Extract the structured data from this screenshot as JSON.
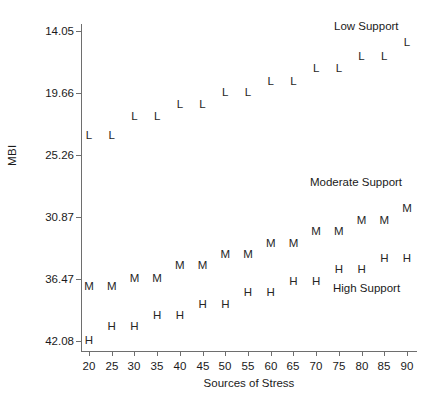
{
  "chart_data": {
    "type": "scatter",
    "title": "",
    "xlabel": "Sources of Stress",
    "ylabel": "MBI",
    "xlim": [
      17.5,
      92.5
    ],
    "ylim": [
      13.0,
      42.9
    ],
    "grid": false,
    "legend_position": "in-plot-annotations",
    "x_ticks": [
      20,
      25,
      30,
      35,
      40,
      45,
      50,
      55,
      60,
      65,
      70,
      75,
      80,
      85,
      90
    ],
    "y_ticks": [
      14.05,
      19.66,
      25.26,
      30.87,
      36.47,
      42.08
    ],
    "x": [
      20,
      25,
      30,
      35,
      40,
      45,
      50,
      55,
      60,
      65,
      70,
      75,
      80,
      85,
      90
    ],
    "series": [
      {
        "name": "Low Support",
        "marker": "L",
        "values": [
          32.6,
          32.6,
          34.3,
          34.3,
          35.4,
          35.4,
          36.5,
          36.5,
          37.5,
          37.5,
          38.6,
          38.6,
          39.7,
          39.7,
          41.0
        ]
      },
      {
        "name": "Moderate Support",
        "marker": "M",
        "values": [
          18.9,
          18.9,
          19.7,
          19.7,
          20.8,
          20.8,
          21.8,
          21.8,
          22.8,
          22.8,
          23.9,
          23.9,
          24.9,
          24.9,
          26.0
        ]
      },
      {
        "name": "High Support",
        "marker": "H",
        "values": [
          14.05,
          15.3,
          15.3,
          16.3,
          16.3,
          17.3,
          17.3,
          18.4,
          18.4,
          19.4,
          19.4,
          20.5,
          20.5,
          21.5,
          21.5
        ]
      }
    ],
    "annotations": [
      {
        "text": "Low Support",
        "for": "Low Support"
      },
      {
        "text": "Moderate Support",
        "for": "Moderate Support"
      },
      {
        "text": "High Support",
        "for": "High Support"
      }
    ]
  },
  "axis": {
    "y_title": "MBI",
    "x_title": "Sources of Stress",
    "y_tick_labels": [
      "42.08",
      "36.47",
      "30.87",
      "25.26",
      "19.66",
      "14.05"
    ],
    "x_tick_labels": [
      "20",
      "25",
      "30",
      "35",
      "40",
      "45",
      "50",
      "55",
      "60",
      "65",
      "70",
      "75",
      "80",
      "85",
      "90"
    ]
  },
  "colors": {
    "axis": "#6e6e6e",
    "text": "#1a1a1a",
    "marker": "#262626",
    "background": "#ffffff"
  }
}
